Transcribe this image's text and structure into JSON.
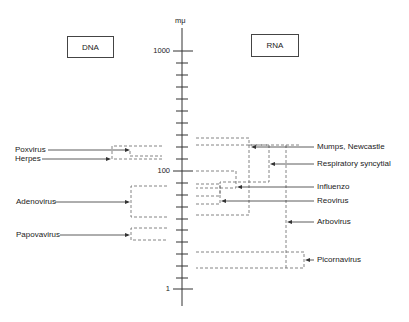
{
  "diagram": {
    "axis": {
      "unit_label": "mμ",
      "tick_labels": {
        "1000": "1000",
        "100": "100",
        "1": "1"
      },
      "scale": "logarithmic",
      "range": [
        1,
        1000
      ]
    },
    "categories": {
      "dna": "DNA",
      "rna": "RNA"
    },
    "dna_viruses": [
      {
        "name": "Poxvirus",
        "size_range_mu": [
          200,
          300
        ]
      },
      {
        "name": "Herpes",
        "size_range_mu": [
          150,
          200
        ]
      },
      {
        "name": "Adenovirus",
        "size_range_mu": [
          45,
          90
        ]
      },
      {
        "name": "Papovavirus",
        "size_range_mu": [
          30,
          45
        ]
      }
    ],
    "rna_viruses": [
      {
        "name": "Mumps, Newcastle",
        "size_range_mu": [
          100,
          300
        ]
      },
      {
        "name": "Respiratory syncytial",
        "size_range_mu": [
          60,
          200
        ]
      },
      {
        "name": "Influenzo",
        "size_range_mu": [
          60,
          100
        ]
      },
      {
        "name": "Reovirus",
        "size_range_mu": [
          55,
          75
        ]
      },
      {
        "name": "Arbovirus",
        "size_range_mu": [
          15,
          200
        ]
      },
      {
        "name": "Picornavirus",
        "size_range_mu": [
          15,
          30
        ]
      }
    ]
  }
}
